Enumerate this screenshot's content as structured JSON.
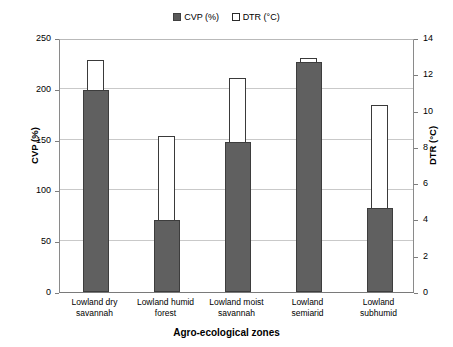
{
  "chart_data": {
    "type": "bar",
    "title": "",
    "subtitle": "",
    "xlabel": "Agro-ecological zones",
    "ylabel": "CVP (%)",
    "ylabel_secondary": "DTR (°C)",
    "categories": [
      "Lowland dry savannah",
      "Lowland humid forest",
      "Lowland moist savannah",
      "Lowland semiarid",
      "Lowland subhumid"
    ],
    "category_lines": [
      [
        "Lowland dry",
        "savannah"
      ],
      [
        "Lowland humid",
        "forest"
      ],
      [
        "Lowland moist",
        "savannah"
      ],
      [
        "Lowland",
        "semiarid"
      ],
      [
        "Lowland",
        "subhumid"
      ]
    ],
    "series": [
      {
        "name": "CVP (%)",
        "axis": "left",
        "color": "#606060",
        "fill": "solid",
        "values": [
          199,
          71,
          148,
          226,
          83
        ]
      },
      {
        "name": "DTR (°C)",
        "axis": "right",
        "color": "#ffffff",
        "fill": "open",
        "values": [
          12.8,
          8.6,
          11.8,
          12.9,
          10.3
        ]
      }
    ],
    "ylim": [
      0,
      250
    ],
    "yticks": [
      0,
      50,
      100,
      150,
      200,
      250
    ],
    "ylim_secondary": [
      0,
      14
    ],
    "yticks_secondary": [
      0,
      2,
      4,
      6,
      8,
      10,
      12,
      14
    ],
    "grid": true,
    "grid_axis": "y",
    "legend_position": "top-center",
    "legend": [
      {
        "label": "CVP (%)",
        "swatch": "filled-square"
      },
      {
        "label": "DTR (°C)",
        "swatch": "open-square"
      }
    ]
  }
}
